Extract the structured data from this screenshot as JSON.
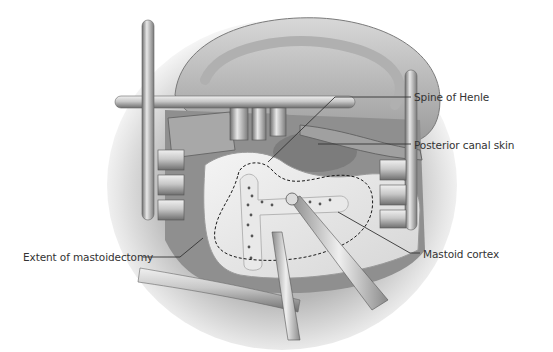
{
  "figure": {
    "colors": {
      "background": "#ffffff",
      "label_text": "#333333",
      "leader_line": "#333333",
      "dashed_outline": "#1a1a1a"
    }
  },
  "labels": {
    "spine_of_henle": "Spine of Henle",
    "posterior_canal_skin": "Posterior canal skin",
    "extent_of_mastoidectomy": "Extent of mastoidectomy",
    "mastoid_cortex": "Mastoid cortex"
  }
}
